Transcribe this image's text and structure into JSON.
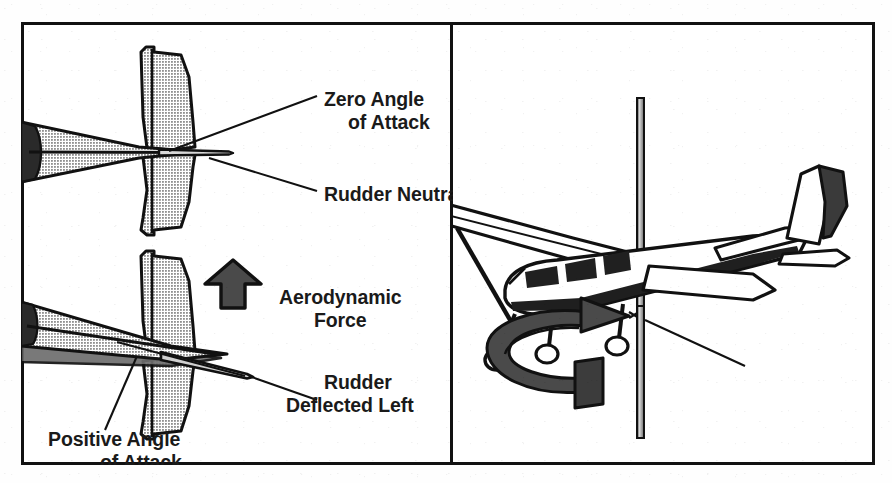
{
  "figure": {
    "panels": [
      {
        "id": "left",
        "name": "rudder-deflection-top-view"
      },
      {
        "id": "right",
        "name": "vertical-axis-yaw-view"
      }
    ]
  },
  "colors": {
    "ink": "#111111",
    "text": "#1a1a1a",
    "halftone_gray": "#b8b8b8",
    "shadow_gray": "#6f6f6f",
    "arrow_gray": "#4a4a4a",
    "paper": "#ffffff"
  },
  "left_panel": {
    "name": "rudder-deflection-diagram",
    "upper_aircraft": {
      "name": "aircraft-top-view-neutral",
      "condition": "rudder neutral, no yaw"
    },
    "lower_aircraft": {
      "name": "aircraft-top-view-yawed",
      "condition": "rudder deflected left, aircraft yawed"
    },
    "labels": {
      "zero_angle_line1": "Zero Angle",
      "zero_angle_line2": "of Attack",
      "rudder_neutral": "Rudder Neutral",
      "aerodynamic_line1": "Aerodynamic",
      "aerodynamic_line2": "Force",
      "rudder_deflected_line1": "Rudder",
      "rudder_deflected_line2": "Deflected Left",
      "positive_angle_line1": "Positive Angle",
      "positive_angle_line2": "of Attack"
    },
    "force_arrow": {
      "name": "aerodynamic-force-arrow",
      "direction": "up"
    }
  },
  "right_panel": {
    "name": "vertical-axis-diagram",
    "aircraft": {
      "name": "cessna-high-wing-aircraft",
      "view": "rear-three-quarter"
    },
    "axis_rod": {
      "name": "vertical-axis-rod"
    },
    "rotation_arrow": {
      "name": "yaw-rotation-arrow",
      "direction": "clockwise-viewed-from-above"
    },
    "labels": {
      "vertical_axis": "Vertical Axis"
    }
  }
}
